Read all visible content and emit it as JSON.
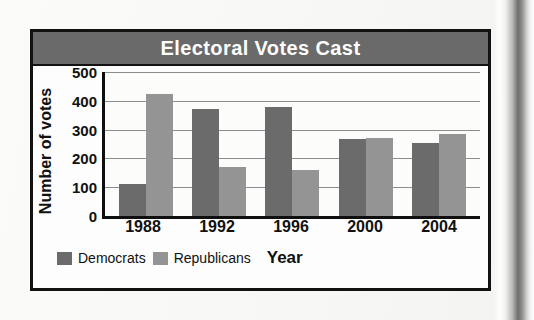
{
  "figure": {
    "title": "Electoral Votes Cast",
    "title_bar_color": "#6a6a6a",
    "border_color": "#121212"
  },
  "chart_data": {
    "type": "bar",
    "title": "Electoral Votes Cast",
    "xlabel": "Year",
    "ylabel": "Number of votes",
    "categories": [
      "1988",
      "1992",
      "1996",
      "2000",
      "2004"
    ],
    "series": [
      {
        "name": "Democrats",
        "color": "#6b6b6b",
        "values": [
          110,
          370,
          380,
          266,
          252
        ]
      },
      {
        "name": "Republicans",
        "color": "#949494",
        "values": [
          425,
          170,
          160,
          271,
          286
        ]
      }
    ],
    "ylim": [
      0,
      500
    ],
    "yticks": [
      0,
      100,
      200,
      300,
      400,
      500
    ],
    "ytick_labels": [
      "0",
      "100",
      "200",
      "300",
      "400",
      "500"
    ],
    "grid": true,
    "legend_position": "bottom-left"
  }
}
